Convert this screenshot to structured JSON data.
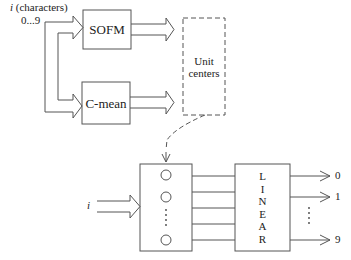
{
  "input_top": {
    "variable": "i",
    "label": "(characters)",
    "range": "0...9"
  },
  "boxes": {
    "sofm": "SOFM",
    "cmean": "C-mean",
    "unit_centers_line1": "Unit",
    "unit_centers_line2": "centers",
    "linear_letters": [
      "L",
      "I",
      "N",
      "E",
      "A",
      "R"
    ]
  },
  "input_bottom": {
    "variable": "i"
  },
  "outputs": [
    "0",
    "1",
    "9"
  ],
  "ellipsis_vertical": "⋮",
  "colors": {
    "stroke": "#555555",
    "text": "#222222",
    "background": "#ffffff"
  }
}
